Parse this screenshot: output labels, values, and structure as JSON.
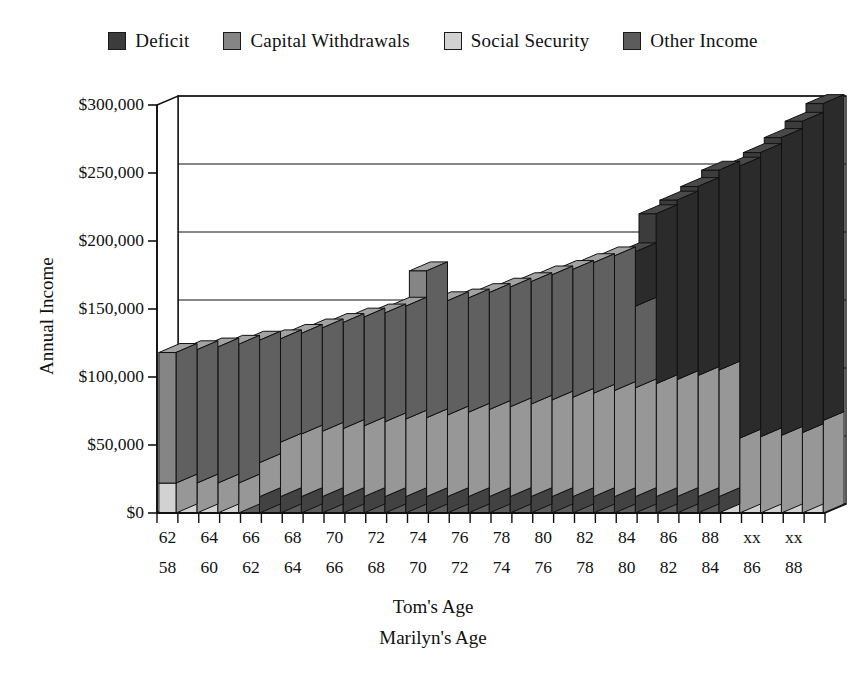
{
  "legend": {
    "items": [
      {
        "label": "Deficit",
        "color": "#3c3c3c",
        "key": "deficit"
      },
      {
        "label": "Capital Withdrawals",
        "color": "#858585",
        "key": "capital_withdrawals"
      },
      {
        "label": "Social Security",
        "color": "#d2d2d2",
        "key": "social_security"
      },
      {
        "label": "Other Income",
        "color": "#5c5c5c",
        "key": "other_income"
      }
    ]
  },
  "axes": {
    "y_title": "Annual Income",
    "x_title_1": "Tom's Age",
    "x_title_2": "Marilyn's Age",
    "y_ticks": [
      "$0",
      "$50,000",
      "$100,000",
      "$150,000",
      "$200,000",
      "$250,000",
      "$300,000"
    ]
  },
  "chart_data": {
    "type": "bar",
    "title": "",
    "xlabel": "Tom's Age / Marilyn's Age",
    "ylabel": "Annual Income",
    "ylim": [
      0,
      300000
    ],
    "ytick_values": [
      0,
      50000,
      100000,
      150000,
      200000,
      250000,
      300000
    ],
    "grid": true,
    "stacked": true,
    "legend_position": "top",
    "stack_order_bottom_to_top": [
      "other_income",
      "social_security",
      "capital_withdrawals",
      "deficit"
    ],
    "categories_tom": [
      "62",
      "63",
      "64",
      "65",
      "66",
      "67",
      "68",
      "69",
      "70",
      "71",
      "72",
      "73",
      "74",
      "75",
      "76",
      "77",
      "78",
      "79",
      "80",
      "81",
      "82",
      "83",
      "84",
      "85",
      "86",
      "87",
      "88",
      "89",
      "xx",
      "xx",
      "xx",
      "xx"
    ],
    "categories_marilyn": [
      "58",
      "59",
      "60",
      "61",
      "62",
      "63",
      "64",
      "65",
      "66",
      "67",
      "68",
      "69",
      "70",
      "71",
      "72",
      "73",
      "74",
      "75",
      "76",
      "77",
      "78",
      "79",
      "80",
      "81",
      "82",
      "83",
      "84",
      "85",
      "86",
      "87",
      "88",
      "89"
    ],
    "tick_labels_tom": [
      "62",
      "",
      "64",
      "",
      "66",
      "",
      "68",
      "",
      "70",
      "",
      "72",
      "",
      "74",
      "",
      "76",
      "",
      "78",
      "",
      "80",
      "",
      "82",
      "",
      "84",
      "",
      "86",
      "",
      "88",
      "",
      "xx",
      "",
      "xx",
      ""
    ],
    "tick_labels_marilyn": [
      "58",
      "",
      "60",
      "",
      "62",
      "",
      "64",
      "",
      "66",
      "",
      "68",
      "",
      "70",
      "",
      "72",
      "",
      "74",
      "",
      "76",
      "",
      "78",
      "",
      "80",
      "",
      "82",
      "",
      "84",
      "",
      "86",
      "",
      "88",
      ""
    ],
    "series": [
      {
        "name": "Other Income",
        "key": "other_income",
        "values": [
          0,
          0,
          0,
          0,
          12000,
          12000,
          12000,
          12000,
          12000,
          12000,
          12000,
          12000,
          12000,
          12000,
          12000,
          12000,
          12000,
          12000,
          12000,
          12000,
          12000,
          12000,
          12000,
          12000,
          12000,
          12000,
          12000,
          0,
          0,
          0,
          0,
          0
        ]
      },
      {
        "name": "Social Security",
        "key": "social_security",
        "values": [
          22000,
          22000,
          22000,
          22000,
          25000,
          40000,
          46000,
          48000,
          50000,
          52000,
          55000,
          57000,
          58000,
          60000,
          62000,
          64000,
          66000,
          68000,
          71000,
          73000,
          76000,
          78000,
          80000,
          83000,
          86000,
          89000,
          93000,
          55000,
          56000,
          57000,
          59000,
          68000
        ]
      },
      {
        "name": "Capital Withdrawals",
        "key": "capital_withdrawals",
        "values": [
          96000,
          98000,
          100000,
          102000,
          90000,
          76000,
          74000,
          76000,
          78000,
          80000,
          80000,
          83000,
          108000,
          84000,
          84000,
          86000,
          88000,
          90000,
          92000,
          94000,
          96000,
          99000,
          60000,
          0,
          0,
          0,
          0,
          0,
          0,
          0,
          0,
          0
        ]
      },
      {
        "name": "Deficit",
        "key": "deficit",
        "values": [
          0,
          0,
          0,
          0,
          0,
          0,
          0,
          0,
          0,
          0,
          0,
          0,
          0,
          0,
          0,
          0,
          0,
          0,
          0,
          0,
          0,
          0,
          40000,
          125000,
          132000,
          139000,
          147000,
          200000,
          209000,
          219000,
          229000,
          233000
        ]
      }
    ],
    "totals": [
      118000,
      120000,
      122000,
      124000,
      127000,
      128000,
      132000,
      136000,
      140000,
      144000,
      147000,
      152000,
      178000,
      156000,
      158000,
      162000,
      166000,
      170000,
      175000,
      179000,
      184000,
      189000,
      192000,
      208000,
      218000,
      228000,
      240000,
      255000,
      265000,
      276000,
      288000,
      301000
    ],
    "annotations": [
      {
        "text": "Spike at Tom age 74 / Marilyn 70 from a one-time capital withdrawal",
        "x_index": 12,
        "value": 178000
      },
      {
        "text": "Deficit begins around Tom age 84 / Marilyn 80",
        "x_index": 22,
        "value": 192000
      }
    ]
  }
}
